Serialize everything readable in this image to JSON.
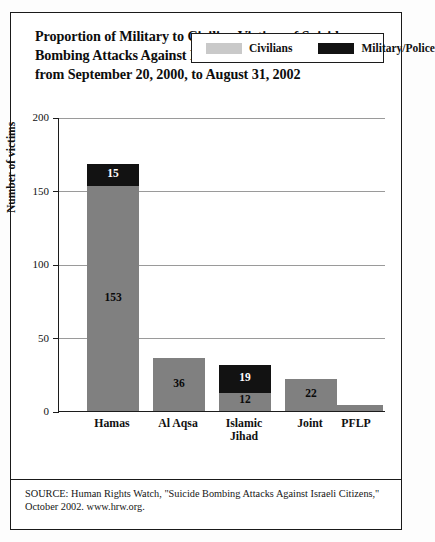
{
  "title": {
    "line1": "Proportion of Military to Civilian Victims of Suicide",
    "line2": "Bombing Attacks Against Israelis by Perpetrator Groups",
    "line3": "from September 20, 2000, to August 31, 2002"
  },
  "legend": {
    "civilians_label": "Civilians",
    "military_label": "Military/Police",
    "civilians_color": "#c9c9c9",
    "military_color": "#121212"
  },
  "axis": {
    "ylabel": "Number of victims",
    "yticks": [
      "0",
      "50",
      "100",
      "150",
      "200"
    ]
  },
  "source": {
    "line1": "SOURCE: Human Rights Watch, \"Suicide Bombing Attacks Against Israeli Citizens,\"",
    "line2": "October 2002. www.hrw.org."
  },
  "chart_data": {
    "type": "bar",
    "title": "Proportion of Military to Civilian Victims of Suicide Bombing Attacks Against Israelis by Perpetrator Groups from September 20, 2000, to August 31, 2002",
    "xlabel": "",
    "ylabel": "Number of victims",
    "ylim": [
      0,
      200
    ],
    "ytick_values": [
      0,
      50,
      100,
      150,
      200
    ],
    "grid": true,
    "stacked": true,
    "legend_position": "top-right-inside",
    "categories": [
      "Hamas",
      "Al Aqsa",
      "Islamic Jihad",
      "Joint",
      "PFLP"
    ],
    "series": [
      {
        "name": "Civilians",
        "color": "#808080",
        "values": [
          153,
          36,
          12,
          22,
          4
        ],
        "data_labels": [
          "153",
          "36",
          "12",
          "22",
          ""
        ]
      },
      {
        "name": "Military/Police",
        "color": "#121212",
        "values": [
          15,
          0,
          19,
          0,
          0
        ],
        "data_labels": [
          "15",
          "",
          "19",
          "",
          ""
        ]
      }
    ],
    "totals": [
      168,
      36,
      31,
      22,
      4
    ]
  },
  "bars": [
    {
      "category": "Hamas",
      "label_lines": [
        "Hamas"
      ],
      "x": 28,
      "width": 52,
      "civ": 153,
      "mil": 15,
      "civ_label": "153",
      "mil_label": "15"
    },
    {
      "category": "Al Aqsa",
      "label_lines": [
        "Al Aqsa"
      ],
      "x": 94,
      "width": 52,
      "civ": 36,
      "mil": 0,
      "civ_label": "36",
      "mil_label": ""
    },
    {
      "category": "Islamic Jihad",
      "label_lines": [
        "Islamic",
        "Jihad"
      ],
      "x": 160,
      "width": 52,
      "civ": 12,
      "mil": 19,
      "civ_label": "12",
      "mil_label": "19"
    },
    {
      "category": "Joint",
      "label_lines": [
        "Joint"
      ],
      "x": 226,
      "width": 52,
      "civ": 22,
      "mil": 0,
      "civ_label": "22",
      "mil_label": ""
    },
    {
      "category": "PFLP",
      "label_lines": [
        "PFLP"
      ],
      "x": 272,
      "width": 52,
      "civ": 4,
      "mil": 0,
      "civ_label": "",
      "mil_label": ""
    }
  ]
}
